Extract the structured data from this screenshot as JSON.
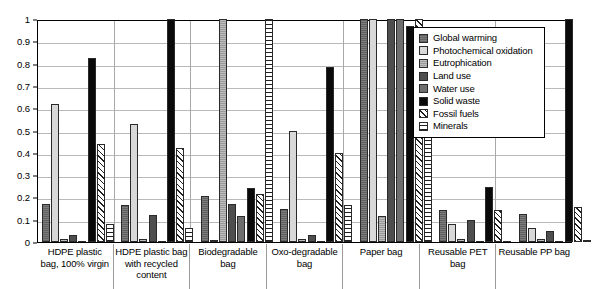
{
  "chart_data": {
    "type": "bar",
    "title": "",
    "xlabel": "",
    "ylabel": "",
    "ylim": [
      0,
      1
    ],
    "grid": true,
    "legend_position": "top-right",
    "ytick_labels": [
      "1",
      "0.9",
      "0.8",
      "0.7",
      "0.6",
      "0.5",
      "0.4",
      "0.3",
      "0.2",
      "0.1",
      "0"
    ],
    "ytick_values": [
      1,
      0.9,
      0.8,
      0.7,
      0.6,
      0.5,
      0.4,
      0.3,
      0.2,
      0.1,
      0
    ],
    "categories": [
      "HDPE plastic bag, 100% virgin",
      "HDPE plastic bag with recycled content",
      "Biodegradable bag",
      "Oxo-degradable bag",
      "Paper bag",
      "Reusable PET bag",
      "Reusable PP bag"
    ],
    "series": [
      {
        "name": "Global warming",
        "swatch": "f-gw",
        "color": "#7c7c7c",
        "values": [
          0.17,
          0.165,
          0.205,
          0.15,
          1.0,
          0.145,
          0.125
        ]
      },
      {
        "name": "Photochemical oxidation",
        "swatch": "f-photo",
        "color": "#d8d8d8",
        "values": [
          0.62,
          0.53,
          0.01,
          0.5,
          1.0,
          0.08,
          0.065
        ]
      },
      {
        "name": "Eutrophication",
        "swatch": "f-eutro",
        "color": "#9a9a9a",
        "values": [
          0.015,
          0.015,
          1.0,
          0.012,
          0.115,
          0.015,
          0.015
        ]
      },
      {
        "name": "Land use",
        "swatch": "f-land",
        "color": "#4e4e4e",
        "values": [
          0.03,
          0.12,
          0.17,
          0.03,
          1.0,
          0.1,
          0.05
        ]
      },
      {
        "name": "Water use",
        "swatch": "f-water",
        "color": "#6e6e6e",
        "values": [
          0.0,
          0.0,
          0.115,
          0.0,
          1.0,
          0.0,
          0.0
        ]
      },
      {
        "name": "Solid waste",
        "swatch": "f-solid",
        "color": "#0a0a0a",
        "values": [
          0.825,
          1.0,
          0.24,
          0.785,
          0.97,
          0.245,
          1.0
        ]
      },
      {
        "name": "Fossil fuels",
        "swatch": "f-fossil",
        "color": "#ffffff",
        "values": [
          0.44,
          0.42,
          0.215,
          0.4,
          1.0,
          0.145,
          0.155
        ]
      },
      {
        "name": "Minerals",
        "swatch": "f-min",
        "color": "#ffffff",
        "values": [
          0.08,
          0.065,
          1.0,
          0.165,
          0.77,
          0.0,
          0.005
        ]
      }
    ]
  }
}
